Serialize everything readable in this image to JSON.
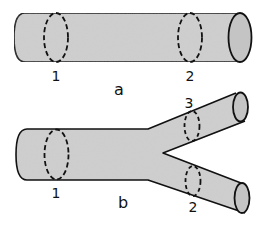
{
  "figure": {
    "colors": {
      "tube_fill": "#cfcfcf",
      "end_cap_fill": "#c4c4c4",
      "outline": "#111111",
      "background": "#ffffff"
    },
    "panel_a": {
      "caption": "a",
      "sections": [
        {
          "label": "1"
        },
        {
          "label": "2"
        }
      ]
    },
    "panel_b": {
      "caption": "b",
      "sections": [
        {
          "label": "1"
        },
        {
          "label": "3"
        },
        {
          "label": "2"
        }
      ]
    }
  }
}
